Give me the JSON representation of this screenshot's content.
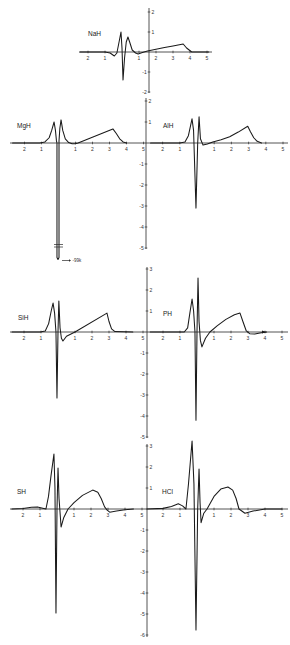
{
  "figure": {
    "panel_order": [
      "NaH",
      "MgH",
      "AlH",
      "SiH",
      "PH",
      "SH",
      "HCl"
    ],
    "line_color": "#1a1a1a",
    "background": "#ffffff"
  },
  "chart_data": [
    {
      "type": "line",
      "title": "NaH",
      "xlim": [
        -2.5,
        5.1
      ],
      "ylim": [
        -2,
        2
      ],
      "xticks": [
        -2,
        -1,
        1,
        2,
        3,
        4,
        5
      ],
      "xtick_labels": [
        "2",
        "1",
        "1",
        "2",
        "3",
        "4",
        "5"
      ],
      "yticks": [
        2,
        1,
        -1,
        -2
      ],
      "ytick_labels": [
        "2",
        "1",
        "-1",
        "-2"
      ],
      "grid": false,
      "series": [
        {
          "name": "NaH",
          "x": [
            -2.5,
            -1.0,
            -0.7,
            -0.45,
            -0.3,
            -0.15,
            -0.06,
            0.0,
            0.06,
            0.15,
            0.25,
            0.35,
            0.45,
            0.6,
            0.8,
            0.95,
            1.2,
            1.5,
            2.0,
            2.5,
            3.0,
            3.6,
            3.8,
            4.1,
            5.1
          ],
          "y": [
            0,
            0,
            -0.05,
            -0.2,
            -0.05,
            0.6,
            1.0,
            0.2,
            -1.4,
            -0.3,
            0.5,
            0.75,
            0.5,
            0.1,
            -0.05,
            -0.1,
            -0.02,
            0.05,
            0.14,
            0.22,
            0.3,
            0.4,
            0.2,
            0,
            0
          ]
        }
      ]
    },
    {
      "type": "line",
      "title": "MgH",
      "xlim": [
        -2.7,
        5
      ],
      "ylim": [
        -5,
        2
      ],
      "xticks": [
        -2,
        -1,
        1,
        2,
        3,
        4,
        5
      ],
      "xtick_labels": [
        "2",
        "1",
        "1",
        "2",
        "3",
        "4",
        "5"
      ],
      "yticks": [
        2,
        1,
        -1,
        -2,
        -3,
        -4,
        -5
      ],
      "ytick_labels": [
        "2",
        "1",
        "-1",
        "-2",
        "-3",
        "-4",
        "-5"
      ],
      "grid": false,
      "annotation": {
        "text": "-99k",
        "arrow": "→",
        "note": "off-scale minimum, axis broken"
      },
      "series": [
        {
          "name": "MgH",
          "x": [
            -2.7,
            -1.1,
            -0.8,
            -0.55,
            -0.4,
            -0.26,
            -0.18,
            -0.12,
            -0.09,
            -0.09,
            -0.03,
            0.03,
            0.03,
            0.08,
            0.15,
            0.25,
            0.4,
            0.6,
            0.8,
            1.0,
            1.15,
            3.2,
            3.4,
            3.6,
            3.8,
            4.0
          ],
          "y": [
            0,
            0,
            0.05,
            0.25,
            0.6,
            1.0,
            0.6,
            0.1,
            0,
            -5.45,
            -5.55,
            -5.45,
            0.1,
            0.7,
            1.1,
            0.6,
            0.2,
            0.02,
            -0.04,
            -0.03,
            0,
            0.67,
            0.45,
            0.2,
            0.05,
            0
          ]
        }
      ]
    },
    {
      "type": "line",
      "title": "AlH",
      "xlim": [
        -2.9,
        5
      ],
      "ylim": [
        -5,
        2
      ],
      "xticks": [
        -2,
        -1,
        1,
        2,
        3,
        4,
        5
      ],
      "xtick_labels": [
        "2",
        "1",
        "1",
        "2",
        "3",
        "4",
        "5"
      ],
      "yticks": [
        2,
        1,
        -1,
        -2,
        -3,
        -4,
        -5
      ],
      "ytick_labels": [
        "2",
        "1",
        "-1",
        "-2",
        "-3",
        "-4",
        "-5"
      ],
      "grid": false,
      "series": [
        {
          "name": "AlH",
          "x": [
            -2.7,
            -1.0,
            -0.7,
            -0.5,
            -0.38,
            -0.29,
            -0.2,
            -0.06,
            0.04,
            0.12,
            0.2,
            0.35,
            0.6,
            0.92,
            1.4,
            1.9,
            2.4,
            2.95,
            3.1,
            3.3,
            3.5,
            3.75
          ],
          "y": [
            0,
            0,
            0.05,
            0.35,
            0.8,
            1.15,
            0.6,
            -3.1,
            0,
            1.25,
            0.2,
            -0.1,
            -0.05,
            0.05,
            0.15,
            0.3,
            0.52,
            0.8,
            0.55,
            0.25,
            0.08,
            0
          ]
        }
      ]
    },
    {
      "type": "line",
      "title": "SiH",
      "xlim": [
        -2.7,
        5
      ],
      "ylim": [
        -5,
        3
      ],
      "xticks": [
        -2,
        -1,
        1,
        2,
        3,
        4,
        5
      ],
      "xtick_labels": [
        "2",
        "1",
        "1",
        "2",
        "3",
        "4",
        "5"
      ],
      "yticks": [
        3,
        2,
        1,
        -1,
        -2,
        -3,
        -4,
        -5
      ],
      "ytick_labels": [
        "3",
        "2",
        "1",
        "-1",
        "-2",
        "-3",
        "-4",
        "-5"
      ],
      "grid": false,
      "series": [
        {
          "name": "SiH",
          "x": [
            -2.7,
            -1.05,
            -0.75,
            -0.55,
            -0.4,
            -0.29,
            -0.2,
            -0.12,
            -0.06,
            0.0,
            0.05,
            0.12,
            0.2,
            0.29,
            0.5,
            1.0,
            2.88,
            3.0,
            3.15,
            3.35,
            4.4
          ],
          "y": [
            0,
            0,
            0.05,
            0.4,
            1.0,
            1.38,
            0.9,
            0,
            -3.14,
            0,
            1.48,
            0.2,
            -0.3,
            -0.43,
            -0.2,
            0,
            0.9,
            0.5,
            0.15,
            0.02,
            0
          ]
        }
      ]
    },
    {
      "type": "line",
      "title": "PH",
      "xlim": [
        -2.9,
        5
      ],
      "ylim": [
        -5,
        3
      ],
      "xticks": [
        -2,
        -1,
        1,
        2,
        3,
        4,
        5
      ],
      "xtick_labels": [
        "2",
        "1",
        "1",
        "2",
        "3",
        "4",
        "5"
      ],
      "yticks": [
        3,
        2,
        1,
        -1,
        -2,
        -3,
        -4,
        -5
      ],
      "ytick_labels": [
        "3",
        "2",
        "1",
        "-1",
        "-2",
        "-3",
        "-4",
        "-5"
      ],
      "grid": false,
      "series": [
        {
          "name": "PH",
          "x": [
            -2.75,
            -0.75,
            -0.55,
            -0.42,
            -0.29,
            -0.2,
            -0.12,
            -0.06,
            0.0,
            0.06,
            0.12,
            0.2,
            0.29,
            0.5,
            0.76,
            1.2,
            1.7,
            2.2,
            2.53,
            2.7,
            2.9,
            3.1,
            3.4,
            3.7,
            4.1
          ],
          "y": [
            0,
            0,
            0.2,
            0.9,
            1.57,
            1.0,
            0,
            -4.2,
            0,
            2.57,
            0.5,
            -0.4,
            -0.71,
            -0.3,
            0,
            0.3,
            0.6,
            0.82,
            0.9,
            0.5,
            0.05,
            -0.08,
            -0.1,
            -0.05,
            0
          ]
        }
      ]
    },
    {
      "type": "line",
      "title": "SH",
      "xlim": [
        -2.65,
        5
      ],
      "ylim": [
        -6,
        3
      ],
      "xticks": [
        -2,
        -1,
        1,
        2,
        3,
        4,
        5
      ],
      "xtick_labels": [
        "2",
        "1",
        "1",
        "2",
        "3",
        "4",
        "5"
      ],
      "yticks": [
        3,
        2,
        1,
        -1,
        -2,
        -3,
        -4,
        -5,
        -6
      ],
      "ytick_labels": [
        "3",
        "2",
        "1",
        "-1",
        "-2",
        "-3",
        "-4",
        "-5",
        "-6"
      ],
      "grid": false,
      "series": [
        {
          "name": "SH",
          "x": [
            -2.65,
            -2.0,
            -1.5,
            -1.15,
            -0.9,
            -0.65,
            -0.5,
            -0.35,
            -0.18,
            -0.12,
            -0.06,
            0.0,
            0.06,
            0.12,
            0.24,
            0.4,
            0.65,
            1.0,
            1.5,
            2.1,
            2.4,
            2.6,
            2.8,
            2.95,
            3.1,
            3.5,
            4.0,
            4.5
          ],
          "y": [
            0,
            0.02,
            0.08,
            0.1,
            0.05,
            0,
            0.6,
            1.6,
            2.62,
            1.0,
            -4.95,
            0,
            1.95,
            0.5,
            -0.86,
            -0.4,
            0,
            0.3,
            0.65,
            0.9,
            0.8,
            0.5,
            0.1,
            -0.05,
            -0.15,
            -0.1,
            -0.04,
            0
          ]
        }
      ]
    },
    {
      "type": "line",
      "title": "HCl",
      "xlim": [
        -2.95,
        5
      ],
      "ylim": [
        -6,
        3
      ],
      "xticks": [
        -2,
        -1,
        1,
        2,
        3,
        4,
        5
      ],
      "xtick_labels": [
        "2",
        "1",
        "1",
        "2",
        "3",
        "4",
        "5"
      ],
      "yticks": [
        3,
        2,
        1,
        -1,
        -2,
        -3,
        -4,
        -5,
        -6
      ],
      "ytick_labels": [
        "3",
        "2",
        "1",
        "-1",
        "-2",
        "-3",
        "-4",
        "-5",
        "-6"
      ],
      "grid": false,
      "series": [
        {
          "name": "HCl",
          "x": [
            -2.95,
            -2.0,
            -1.5,
            -1.1,
            -0.85,
            -0.65,
            -0.5,
            -0.29,
            -0.18,
            -0.06,
            0.04,
            0.12,
            0.18,
            0.24,
            0.4,
            0.59,
            1.0,
            1.4,
            1.82,
            2.1,
            2.3,
            2.47,
            2.82,
            3.3,
            4.0,
            5.0
          ],
          "y": [
            0,
            0.03,
            0.12,
            0.25,
            0.15,
            0,
            1.2,
            3.24,
            1.2,
            -5.76,
            0,
            1.9,
            0.3,
            -0.65,
            -0.2,
            0,
            0.6,
            0.95,
            1.05,
            0.9,
            0.5,
            0,
            -0.2,
            -0.1,
            0,
            0
          ]
        }
      ]
    }
  ]
}
